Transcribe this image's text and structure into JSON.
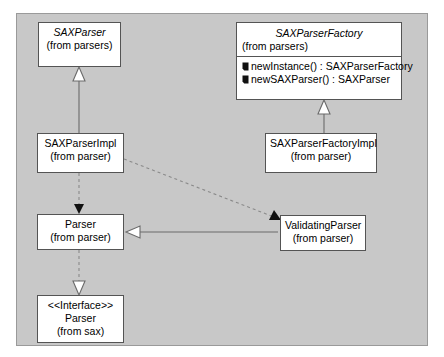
{
  "diagram": {
    "type": "uml-class-diagram",
    "panel_background": "#c8c8c8",
    "node_fill": "#ffffff",
    "line_color": "#6b6b6b"
  },
  "nodes": {
    "sax_parser": {
      "name": "SAXParser",
      "package": "(from parsers)",
      "abstract": true
    },
    "sax_parser_factory": {
      "name": "SAXParserFactory",
      "package": "(from parsers)",
      "abstract": true,
      "operations": [
        {
          "icon": "public-operation-icon",
          "signature": "newInstance() : SAXParserFactory"
        },
        {
          "icon": "public-operation-icon",
          "signature": "newSAXParser() : SAXParser"
        }
      ]
    },
    "sax_parser_impl": {
      "name": "SAXParserImpl",
      "package": "(from parser)",
      "abstract": false
    },
    "sax_parser_factory_impl": {
      "name": "SAXParserFactoryImpl",
      "package": "(from parser)",
      "abstract": false
    },
    "parser": {
      "name": "Parser",
      "package": "(from parser)",
      "abstract": false
    },
    "validating_parser": {
      "name": "ValidatingParser",
      "package": "(from parser)",
      "abstract": false
    },
    "parser_interface": {
      "stereotype": "<<Interface>>",
      "name": "Parser",
      "package": "(from sax)",
      "abstract": false
    }
  },
  "edges": [
    {
      "id": "gen-impl-to-saxparser",
      "from": "sax_parser_impl",
      "to": "sax_parser",
      "kind": "generalization",
      "style": "solid",
      "arrow": "hollow-triangle"
    },
    {
      "id": "gen-factoryimpl-to-factory",
      "from": "sax_parser_factory_impl",
      "to": "sax_parser_factory",
      "kind": "generalization",
      "style": "solid",
      "arrow": "hollow-triangle"
    },
    {
      "id": "dep-impl-to-parser",
      "from": "sax_parser_impl",
      "to": "parser",
      "kind": "dependency",
      "style": "dashed",
      "arrow": "filled-arrow"
    },
    {
      "id": "dep-impl-to-validatingparser",
      "from": "sax_parser_impl",
      "to": "validating_parser",
      "kind": "dependency",
      "style": "dashed",
      "arrow": "filled-arrow"
    },
    {
      "id": "gen-validating-to-parser",
      "from": "validating_parser",
      "to": "parser",
      "kind": "generalization",
      "style": "solid",
      "arrow": "hollow-triangle"
    },
    {
      "id": "real-parser-to-interface",
      "from": "parser",
      "to": "parser_interface",
      "kind": "realization",
      "style": "dashed",
      "arrow": "hollow-triangle"
    }
  ]
}
